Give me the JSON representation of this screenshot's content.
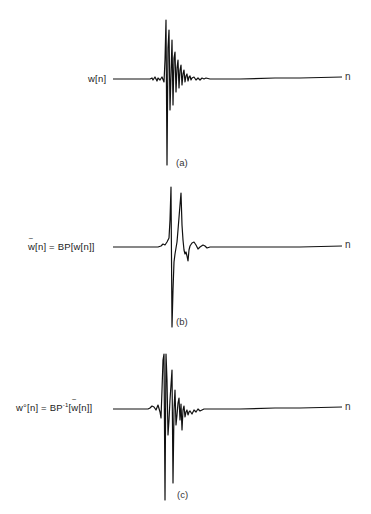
{
  "figure": {
    "panels": [
      {
        "id": "a",
        "signal_label": "w[n]",
        "axis_label": "n",
        "caption": "(a)",
        "description": "original impulse-like wavelet w[n] with main spike and decaying oscillations"
      },
      {
        "id": "b",
        "signal_label_parts": {
          "w": "w",
          "rest": "[n] = BP[w[n]]"
        },
        "signal_label": "w̃[n] = BP[w[n]]",
        "axis_label": "n",
        "caption": "(b)",
        "description": "band-passed signal: two sharp positive peaks, one deep negative trough, small ringing"
      },
      {
        "id": "c",
        "signal_label_parts": {
          "lhs": "w°[n] = BP",
          "sup": "-1",
          "open": "[",
          "w": "w",
          "rest": "[n]]"
        },
        "signal_label": "w°[n] = BP⁻¹[w̃[n]]",
        "axis_label": "n",
        "caption": "(c)",
        "description": "reconstructed signal after inverse band-pass, resembling original w[n]"
      }
    ],
    "colors": {
      "stroke": "#111111",
      "background": "#ffffff"
    }
  }
}
